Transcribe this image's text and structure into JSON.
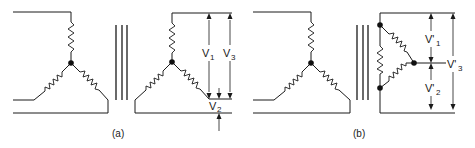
{
  "figure": {
    "panel_a": {
      "caption": "(a)",
      "description": "Star-star transformer connection with voltage measurements",
      "labels": {
        "v1": {
          "main": "V",
          "sub": "1"
        },
        "v2": {
          "main": "V",
          "sub": "2"
        },
        "v3": {
          "main": "V",
          "sub": "3"
        }
      }
    },
    "panel_b": {
      "caption": "(b)",
      "description": "Star-delta transformer connection with voltage measurements",
      "labels": {
        "v1": {
          "main": "V'",
          "sub": "1"
        },
        "v2": {
          "main": "V'",
          "sub": "2"
        },
        "v3": {
          "main": "V'",
          "sub": "3"
        }
      }
    },
    "colors": {
      "line": "#1a1a1a",
      "background": "#ffffff"
    }
  }
}
